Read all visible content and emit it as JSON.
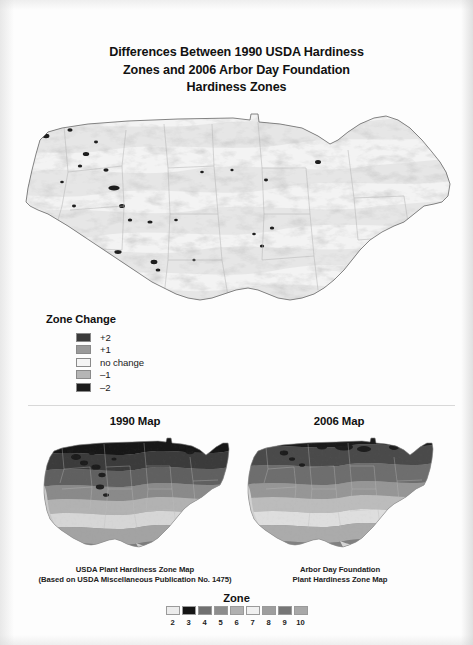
{
  "figure": {
    "title_lines": [
      "Differences Between 1990 USDA Hardiness",
      "Zones and 2006 Arbor Day Foundation",
      "Hardiness Zones"
    ]
  },
  "legend": {
    "title": "Zone Change",
    "items": [
      {
        "label": "+2",
        "color": "#3a3a3a"
      },
      {
        "label": "+1",
        "color": "#9a9a9a"
      },
      {
        "label": "no change",
        "color": "#f4f4f4"
      },
      {
        "label": "–1",
        "color": "#b5b5b5"
      },
      {
        "label": "–2",
        "color": "#1c1c1c"
      }
    ]
  },
  "panels": [
    {
      "title": "1990 Map",
      "caption_lines": [
        "USDA Plant Hardiness Zone Map",
        "(Based on USDA Miscellaneous Publication No. 1475)"
      ]
    },
    {
      "title": "2006 Map",
      "caption_lines": [
        "Arbor Day Foundation",
        "Plant Hardiness Zone Map"
      ]
    }
  ],
  "zone_scale": {
    "title": "Zone",
    "entries": [
      {
        "number": "2",
        "color": "#ececec"
      },
      {
        "number": "3",
        "color": "#141414"
      },
      {
        "number": "4",
        "color": "#707070"
      },
      {
        "number": "5",
        "color": "#8d8d8d"
      },
      {
        "number": "6",
        "color": "#b0b0b0"
      },
      {
        "number": "7",
        "color": "#f0f0f0"
      },
      {
        "number": "8",
        "color": "#9e9e9e"
      },
      {
        "number": "9",
        "color": "#767676"
      },
      {
        "number": "10",
        "color": "#a8a8a8"
      }
    ]
  },
  "map_palette": {
    "outline": "#6e6e6e",
    "state_border": "#a6a6a6",
    "band_light": "#f2f2f2",
    "band_mid": "#9b9b9b",
    "band_dark": "#262626",
    "background": "#ffffff"
  }
}
